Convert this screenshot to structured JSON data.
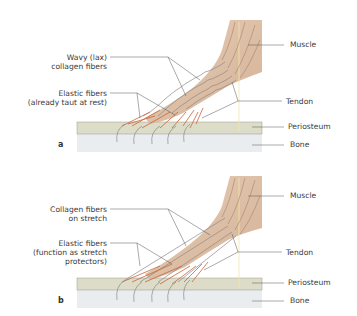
{
  "panels": [
    {
      "letter": "a",
      "left_labels": {
        "collagen_line1": "Wavy (lax)",
        "collagen_line2": "collagen fibers",
        "elastic_line1": "Elastic fibers",
        "elastic_line2": "(already taut at rest)"
      },
      "right_labels": {
        "muscle": "Muscle",
        "tendon": "Tendon",
        "periosteum": "Periosteum",
        "bone": "Bone"
      }
    },
    {
      "letter": "b",
      "left_labels": {
        "collagen_line1": "Collagen fibers",
        "collagen_line2": "on stretch",
        "elastic_line1": "Elastic fibers",
        "elastic_line2": "(function as stretch",
        "elastic_line3": "protectors)"
      },
      "right_labels": {
        "muscle": "Muscle",
        "tendon": "Tendon",
        "periosteum": "Periosteum",
        "bone": "Bone"
      }
    }
  ],
  "colors": {
    "muscle": "#d8b79c",
    "periosteum": "#dcdcc8",
    "bone": "#e8ecef",
    "elastic_fiber": "#c8643a",
    "collagen_fiber": "#8a8a8a",
    "leader_line": "#555555"
  }
}
